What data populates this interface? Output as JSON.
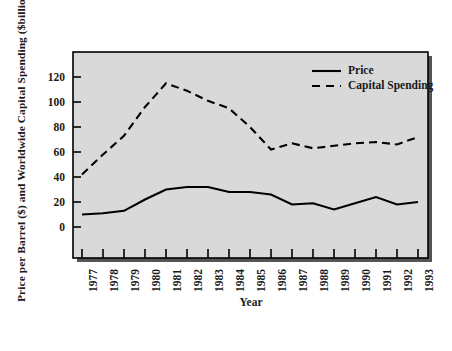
{
  "chart_data": {
    "type": "line",
    "title": "",
    "xlabel": "Year",
    "ylabel": "Price per Barrel ($) and Worldwide Capital Spending ($billions)",
    "categories": [
      "1977",
      "1978",
      "1979",
      "1980",
      "1981",
      "1982",
      "1983",
      "1984",
      "1985",
      "1986",
      "1987",
      "1988",
      "1989",
      "1990",
      "1991",
      "1992",
      "1993"
    ],
    "xlim": [
      1977,
      1993
    ],
    "ylim": [
      0,
      135
    ],
    "yticks": [
      0,
      20,
      40,
      60,
      80,
      100,
      120
    ],
    "grid": false,
    "legend_position": "top-right",
    "series": [
      {
        "name": "Price",
        "style": "solid",
        "color": "#000000",
        "values": [
          10,
          11,
          13,
          22,
          30,
          32,
          32,
          28,
          28,
          26,
          18,
          19,
          14,
          19,
          24,
          18,
          20
        ]
      },
      {
        "name": "Capital Spending",
        "style": "dashed",
        "color": "#000000",
        "values": [
          42,
          58,
          73,
          96,
          115,
          109,
          101,
          95,
          80,
          62,
          67,
          63,
          65,
          67,
          68,
          66,
          72
        ]
      }
    ]
  },
  "legend": {
    "entries": [
      {
        "label": "Price",
        "style": "solid"
      },
      {
        "label": "Capital Spending",
        "style": "dashed"
      }
    ]
  },
  "axes": {
    "y_title": "Price per Barrel ($) and Worldwide Capital Spending ($billions)",
    "x_title": "Year",
    "y_tick_labels": [
      "120",
      "100",
      "80",
      "60",
      "40",
      "20",
      "0"
    ],
    "x_tick_labels": [
      "1977",
      "1978",
      "1979",
      "1980",
      "1981",
      "1982",
      "1983",
      "1984",
      "1985",
      "1986",
      "1987",
      "1988",
      "1989",
      "1990",
      "1991",
      "1992",
      "1993"
    ]
  },
  "style": {
    "plot_background": "#d9d9d9",
    "frame_color": "#000000",
    "shadow_color": "#4d4d4d",
    "page_background": "#ffffff"
  }
}
